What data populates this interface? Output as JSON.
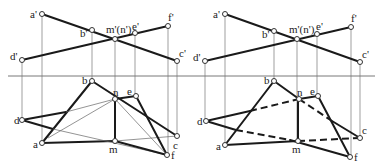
{
  "figure": {
    "axis_y": 76,
    "panels": [
      {
        "name": "left",
        "front_points": {
          "a'": [
            42,
            14
          ],
          "b'": [
            92,
            30
          ],
          "m'(n')": [
            115,
            39
          ],
          "e'": [
            135,
            33
          ],
          "f'": [
            168,
            26
          ],
          "c'": [
            177,
            61
          ],
          "d'": [
            22,
            60
          ]
        },
        "top_points": {
          "b": [
            92,
            81
          ],
          "n": [
            115,
            99
          ],
          "e": [
            136,
            96
          ],
          "d": [
            22,
            120
          ],
          "a": [
            42,
            143
          ],
          "m": [
            115,
            141
          ],
          "c": [
            177,
            136
          ],
          "f": [
            167,
            155
          ]
        },
        "labels": {
          "a_p": "a'",
          "b_p": "b'",
          "mn_p": "m'(n')",
          "e_p": "e'",
          "f_p": "f'",
          "c_p": "c'",
          "d_p": "d'",
          "b": "b",
          "n": "n",
          "e": "e",
          "d": "d",
          "a": "a",
          "m": "m",
          "c": "c",
          "f": "f"
        }
      },
      {
        "name": "right",
        "front_points": {
          "a'": [
            225,
            14
          ],
          "b'": [
            274,
            31
          ],
          "m'(n')": [
            297,
            39
          ],
          "e'": [
            317,
            34
          ],
          "f'": [
            351,
            27
          ],
          "c'": [
            360,
            62
          ],
          "d'": [
            205,
            61
          ]
        },
        "top_points": {
          "b": [
            274,
            81
          ],
          "n": [
            299,
            99
          ],
          "e": [
            318,
            96
          ],
          "d": [
            206,
            121
          ],
          "a": [
            225,
            145
          ],
          "m": [
            298,
            141
          ],
          "c": [
            360,
            138
          ],
          "f": [
            350,
            157
          ]
        },
        "labels": {
          "a_p": "a'",
          "b_p": "b'",
          "mn_p": "m'(n')",
          "e_p": "e'",
          "f_p": "f'",
          "c_p": "c'",
          "d_p": "d'",
          "b": "b",
          "n": "n",
          "e": "e",
          "d": "d",
          "a": "a",
          "m": "m",
          "c": "c",
          "f": "f"
        }
      }
    ]
  }
}
